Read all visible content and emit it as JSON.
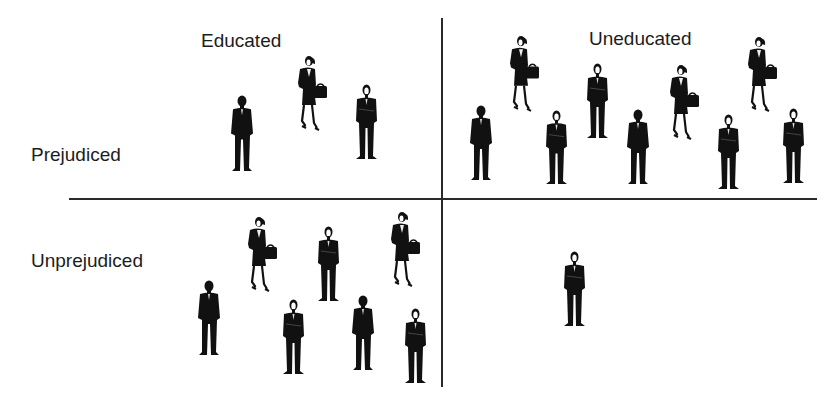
{
  "diagram": {
    "column_labels": [
      "Educated",
      "Uneducated"
    ],
    "row_labels": [
      "Prejudiced",
      "Unprejudiced"
    ],
    "quadrants": [
      {
        "id": "educated-prejudiced",
        "count": 3,
        "composition": {
          "men": 2,
          "women": 1
        }
      },
      {
        "id": "uneducated-prejudiced",
        "count": 9,
        "composition": {
          "men": 6,
          "women": 3
        }
      },
      {
        "id": "educated-unprejudiced",
        "count": 7,
        "composition": {
          "men": 5,
          "women": 2
        }
      },
      {
        "id": "uneducated-unprejudiced",
        "count": 1,
        "composition": {
          "men": 1,
          "women": 0
        }
      }
    ],
    "figure_icon": {
      "man": "businessman-silhouette-icon",
      "woman": "businesswoman-with-briefcase-icon"
    },
    "colors": {
      "figure": "#111111",
      "axis": "#2a2a2a",
      "background": "#ffffff"
    }
  }
}
